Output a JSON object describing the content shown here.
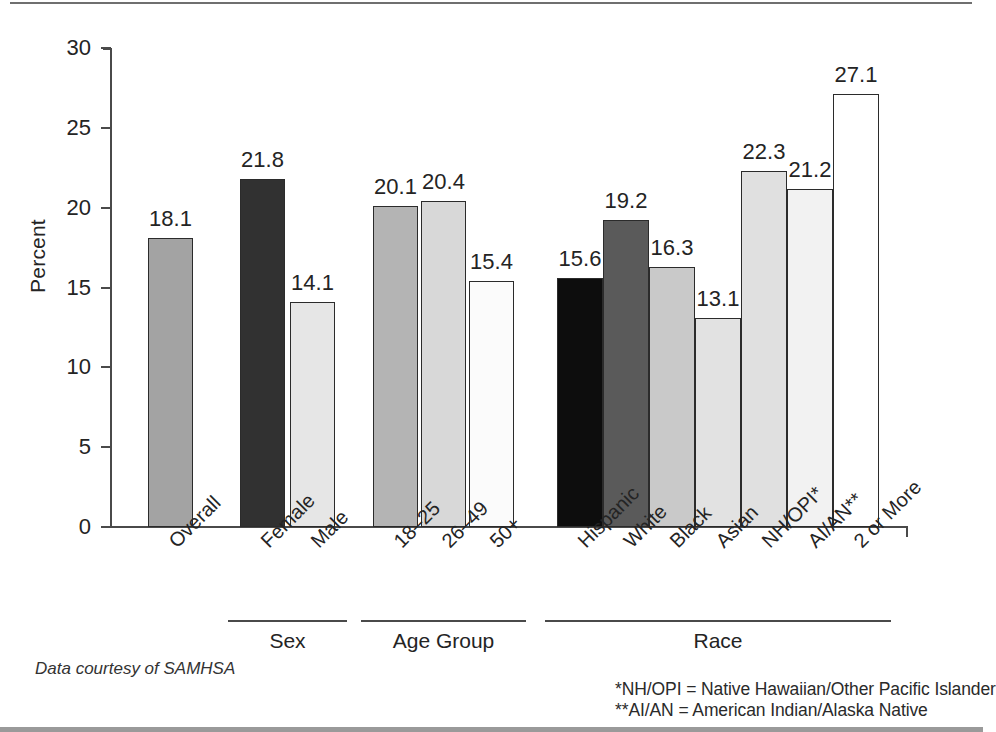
{
  "chart_data": {
    "type": "bar",
    "title": "",
    "xlabel": "",
    "ylabel": "Percent",
    "ylim": [
      0,
      30
    ],
    "yticks": [
      "0",
      "5",
      "10",
      "15",
      "20",
      "25",
      "30"
    ],
    "grid": false,
    "legend": "none",
    "categories": [
      "Overall",
      "Female",
      "Male",
      "18–25",
      "26–49",
      "50+",
      "Hispanic",
      "White",
      "Black",
      "Asian",
      "NH/OPI*",
      "AI/AN**",
      "2 or More"
    ],
    "values": [
      18.1,
      21.8,
      14.1,
      20.1,
      20.4,
      15.4,
      15.6,
      19.2,
      16.3,
      13.1,
      22.3,
      21.2,
      27.1
    ],
    "value_labels": [
      "18.1",
      "21.8",
      "14.1",
      "20.1",
      "20.4",
      "15.4",
      "15.6",
      "19.2",
      "16.3",
      "13.1",
      "22.3",
      "21.2",
      "27.1"
    ],
    "bar_fills": [
      "#a3a3a3",
      "#313131",
      "#e6e6e6",
      "#b4b4b4",
      "#d8d8d8",
      "#fbfbfb",
      "#0d0d0d",
      "#5a5a5a",
      "#c9c9c9",
      "#e2e2e2",
      "#e0e0e0",
      "#f2f2f2",
      "#ffffff"
    ],
    "groups": [
      {
        "label": "Sex",
        "first": 1,
        "last": 2
      },
      {
        "label": "Age Group",
        "first": 3,
        "last": 5
      },
      {
        "label": "Race",
        "first": 6,
        "last": 12
      }
    ],
    "annotations": {
      "source": "Data courtesy of SAMHSA",
      "footnote_1": "*NH/OPI = Native Hawaiian/Other Pacific Islander",
      "footnote_2": "**AI/AN = American Indian/Alaska Native"
    },
    "colors": {
      "axis": "#4a4a4a",
      "bar_outline": "#2b2b2b",
      "text": "#242424"
    }
  }
}
